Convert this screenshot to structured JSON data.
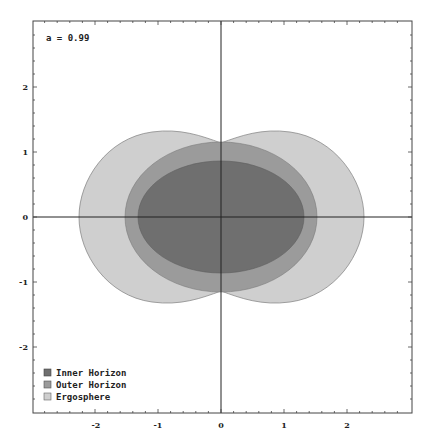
{
  "chart_data": {
    "type": "area",
    "title": "",
    "annotation": "a = 0.99",
    "xlabel": "",
    "ylabel": "",
    "xlim": [
      -3,
      3
    ],
    "ylim": [
      -3,
      3
    ],
    "x_ticks": [
      "-2",
      "-1",
      "0",
      "1",
      "2"
    ],
    "y_ticks": [
      "2",
      "1",
      "0",
      "-1",
      "-2"
    ],
    "grid": false,
    "legend_position": "bottom-left",
    "series": [
      {
        "name": "Inner Horizon",
        "color": "#6f6f6f",
        "shape": "ellipse",
        "x_extent": [
          -1.32,
          1.32
        ],
        "y_extent": [
          -0.86,
          0.86
        ]
      },
      {
        "name": "Outer Horizon",
        "color": "#9b9b9b",
        "shape": "ellipse",
        "x_extent": [
          -1.52,
          1.52
        ],
        "y_extent": [
          -1.16,
          1.16
        ]
      },
      {
        "name": "Ergosphere",
        "color": "#cfcfcf",
        "shape": "peanut",
        "x_extent": [
          -2.25,
          2.25
        ],
        "y_extent": [
          -1.3,
          1.3
        ],
        "y_at_x0": 1.14
      }
    ]
  },
  "legend": {
    "items": [
      {
        "label": "Inner Horizon",
        "color": "#6f6f6f"
      },
      {
        "label": "Outer Horizon",
        "color": "#9b9b9b"
      },
      {
        "label": "Ergosphere",
        "color": "#cfcfcf"
      }
    ]
  },
  "axes": {
    "x_ticks": [
      "-2",
      "-1",
      "0",
      "1",
      "2"
    ],
    "y_ticks": [
      "2",
      "1",
      "0",
      "-1",
      "-2"
    ]
  },
  "annotation": "a = 0.99"
}
